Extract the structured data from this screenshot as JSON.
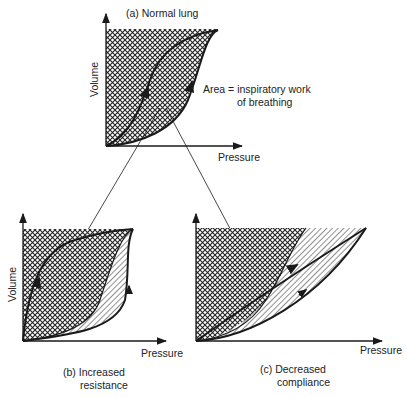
{
  "panels": {
    "a": {
      "caption": "(a)  Normal lung",
      "y_label": "Volume",
      "x_label": "Pressure"
    },
    "b": {
      "caption_line1": "(b)  Increased",
      "caption_line2": "resistance",
      "y_label": "Volume",
      "x_label": "Pressure"
    },
    "c": {
      "caption_line1": "(c)  Decreased",
      "caption_line2": "compliance",
      "x_label": "Pressure"
    }
  },
  "annotation": {
    "line1": "Area =  inspiratory work",
    "line2": "of breathing"
  },
  "colors": {
    "ink": "#1a1a1a",
    "background": "#ffffff"
  }
}
